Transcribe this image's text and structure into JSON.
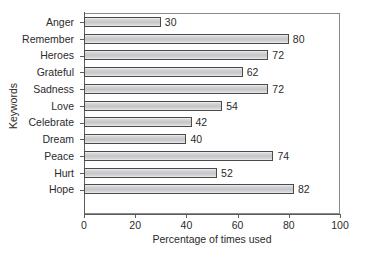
{
  "chart_data": {
    "type": "bar",
    "orientation": "horizontal",
    "title": "",
    "xlabel": "Percentage of times used",
    "ylabel": "Keywords",
    "categories": [
      "Anger",
      "Remember",
      "Heroes",
      "Grateful",
      "Sadness",
      "Love",
      "Celebrate",
      "Dream",
      "Peace",
      "Hurt",
      "Hope"
    ],
    "values": [
      30,
      80,
      72,
      62,
      72,
      54,
      42,
      40,
      74,
      52,
      82
    ],
    "value_labels": [
      "30",
      "80",
      "72",
      "62",
      "72",
      "54",
      "42",
      "40",
      "74",
      "52",
      "82"
    ],
    "xlim": [
      0,
      100
    ],
    "xticks": [
      0,
      20,
      40,
      60,
      80,
      100
    ],
    "xtick_labels": [
      "0",
      "20",
      "40",
      "60",
      "80",
      "100"
    ],
    "grid": false,
    "legend": false,
    "bar_fill_color": "#c9c9cd",
    "bar_edge_color": "#4a4a4a",
    "axis_color": "#5c5c5c",
    "text_color": "#2b2b2b",
    "background_color": "#ffffff"
  }
}
